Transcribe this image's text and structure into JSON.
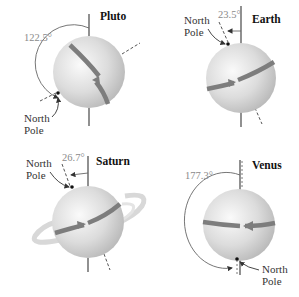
{
  "figure": {
    "panels": [
      {
        "planet": "Pluto",
        "tilt_label": "122.5°",
        "pole_label_line1": "North",
        "pole_label_line2": "Pole"
      },
      {
        "planet": "Earth",
        "tilt_label": "23.5°",
        "pole_label_line1": "North",
        "pole_label_line2": "Pole"
      },
      {
        "planet": "Saturn",
        "tilt_label": "26.7°",
        "pole_label_line1": "North",
        "pole_label_line2": "Pole"
      },
      {
        "planet": "Venus",
        "tilt_label": "177.3°",
        "pole_label_line1": "North",
        "pole_label_line2": "Pole"
      }
    ],
    "colors": {
      "sphere_light": "#f4f4f4",
      "sphere_dark": "#b8b8b8",
      "band": "#7d7d7d",
      "axis": "#555555",
      "ring": "#d6d6d6"
    }
  }
}
